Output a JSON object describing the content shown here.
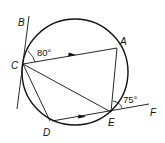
{
  "diagram": {
    "type": "geometry-circle-inscribed-quadrilateral",
    "stroke_color": "#111111",
    "background": "#ffffff",
    "points": {
      "A": {
        "label": "A"
      },
      "B": {
        "label": "B"
      },
      "C": {
        "label": "C"
      },
      "D": {
        "label": "D"
      },
      "E": {
        "label": "E"
      },
      "F": {
        "label": "F"
      }
    },
    "angles": {
      "BCA": {
        "label": "80°"
      },
      "AEF": {
        "label": "75°"
      }
    },
    "segments": [
      "CA",
      "AE",
      "CE",
      "CD",
      "DE"
    ],
    "tangent_lines": [
      "BC",
      "EF"
    ],
    "parallel_marks": [
      "CA",
      "DE"
    ]
  }
}
